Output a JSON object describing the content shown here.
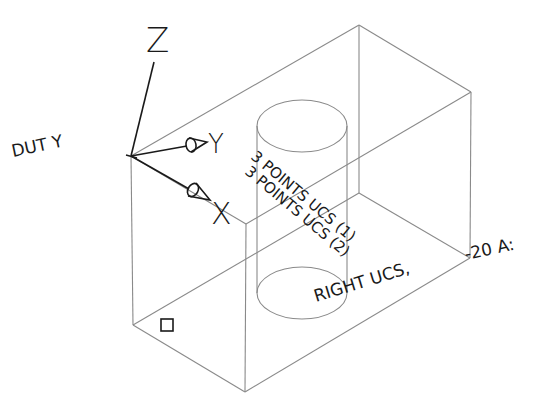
{
  "drawing": {
    "labels": {
      "out_y": "DUT Y",
      "z_axis": "Z",
      "y_axis": "Y",
      "x_axis": "X",
      "ucs_note_1": "3 POINTS UCS (1)",
      "ucs_note_2": "3 POINTS UCS (2)",
      "right_ucs": "RIGHT UCS,",
      "angle_note": "-20 A:"
    },
    "colors": {
      "edges": "#8a8a8a",
      "axes": "#1a1a1a",
      "text": "#1a1a1a",
      "background": "#ffffff"
    },
    "box_vertices": {
      "top_left": [
        131,
        156
      ],
      "top_back": [
        359,
        25
      ],
      "top_right": [
        471,
        92
      ],
      "top_front": [
        246,
        224
      ],
      "bottom_left": [
        133,
        325
      ],
      "bottom_back": [
        359,
        193
      ],
      "bottom_right": [
        470,
        258
      ],
      "bottom_front": [
        245,
        392
      ]
    },
    "cylinder": {
      "top_center": [
        302,
        126
      ],
      "bottom_center": [
        302,
        293
      ],
      "rx": 45,
      "ry": 26
    },
    "ucs_icon": {
      "origin": [
        131,
        156
      ],
      "z_end": [
        154,
        62
      ],
      "y_end": [
        193,
        143
      ],
      "x_end": [
        196,
        195
      ]
    },
    "marker_square": {
      "x": 161,
      "y": 319,
      "size": 12
    }
  }
}
